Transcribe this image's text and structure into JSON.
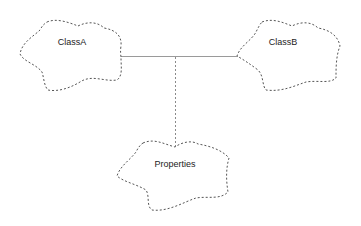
{
  "diagram": {
    "type": "uml-booch-class-diagram",
    "nodes": [
      {
        "id": "classA",
        "label": "ClassA",
        "shape": "dashed-cloud"
      },
      {
        "id": "classB",
        "label": "ClassB",
        "shape": "dashed-cloud"
      },
      {
        "id": "properties",
        "label": "Properties",
        "shape": "dashed-cloud"
      }
    ],
    "edges": [
      {
        "from": "classA",
        "to": "classB",
        "style": "solid",
        "kind": "association"
      },
      {
        "from": "association-midpoint",
        "to": "properties",
        "style": "dashed",
        "kind": "association-class-link"
      }
    ],
    "colors": {
      "background": "#ffffff",
      "cloud_stroke": "#555555",
      "solid_link": "#9a9a9a",
      "dashed_link": "#8a8a8a",
      "text": "#222222"
    }
  }
}
